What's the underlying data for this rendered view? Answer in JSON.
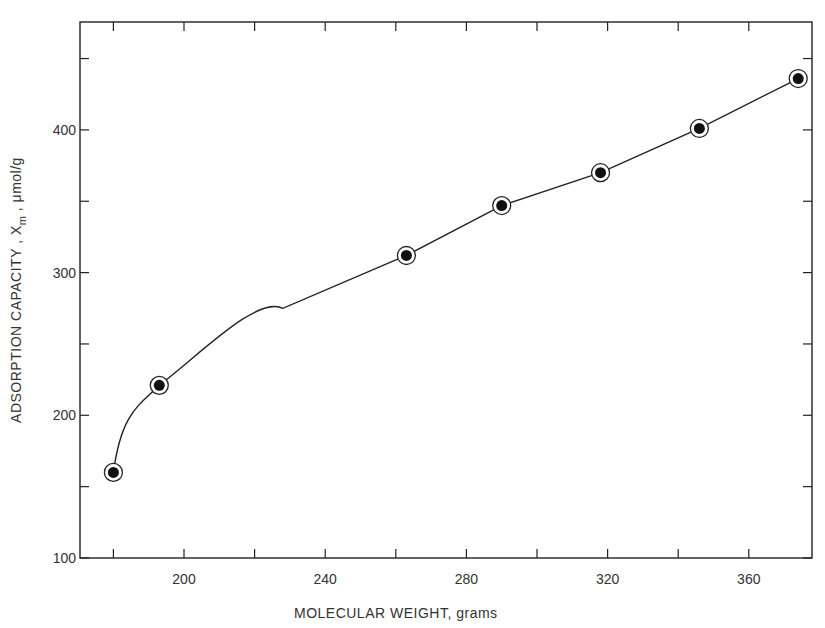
{
  "chart_data": {
    "type": "line",
    "title": "",
    "xlabel": "MOLECULAR WEIGHT, grams",
    "ylabel": "ADSORPTION CAPACITY, X_m, μmol/g",
    "ylabel_parts": {
      "main": "ADSORPTION  CAPACITY , X",
      "sub": "m",
      "tail": " , μmol/g"
    },
    "xlim": [
      170,
      380
    ],
    "ylim": [
      100,
      480
    ],
    "x_ticks": [
      200,
      240,
      280,
      320,
      360
    ],
    "x_minor_ticks": [
      180,
      220,
      260,
      300,
      340,
      380
    ],
    "y_ticks": [
      100,
      200,
      300,
      400
    ],
    "y_minor_ticks": [
      150,
      250,
      350,
      450
    ],
    "grid": false,
    "legend": null,
    "series": [
      {
        "name": "Adsorption capacity",
        "marker": "circled-dot",
        "x": [
          180,
          193,
          263,
          290,
          318,
          346,
          374
        ],
        "y": [
          160,
          221,
          312,
          347,
          370,
          401,
          436
        ]
      }
    ]
  }
}
